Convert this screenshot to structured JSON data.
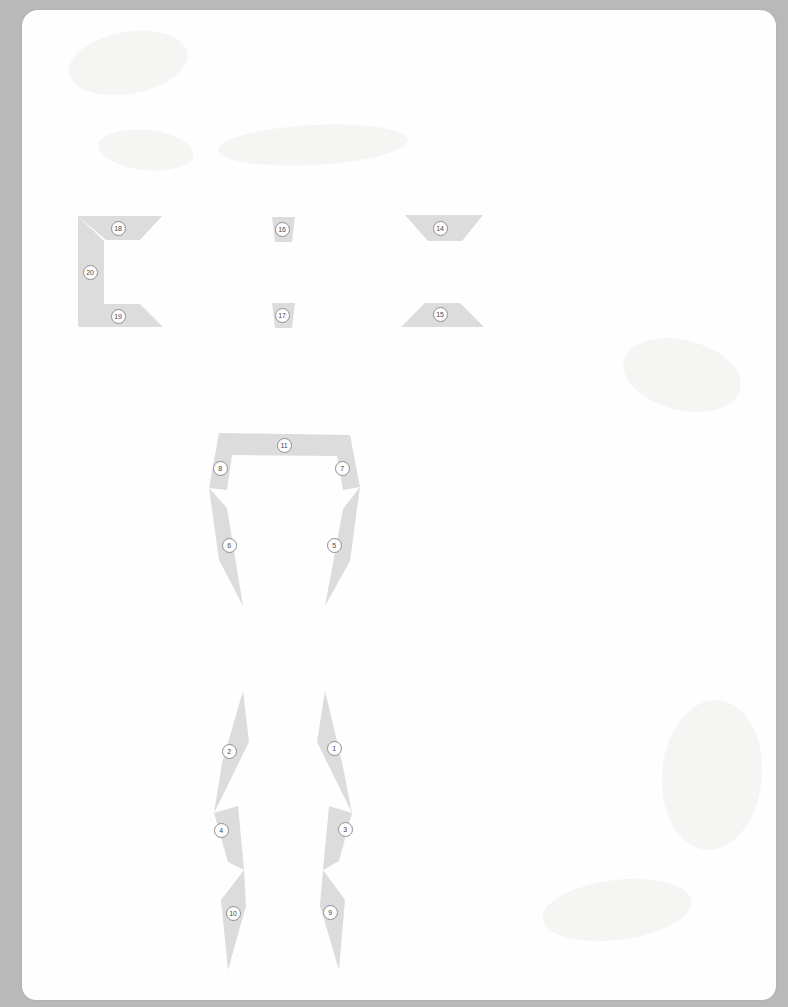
{
  "document": {
    "kind": "scanned-diagram-page",
    "background_color": "#b9b9b9",
    "page_color": "#fefefe",
    "segment_fill_color": "#dcdcdc",
    "badge_fill_color": "#fdfdfd",
    "badge_border_color": "#8f8f8f",
    "badge_text_color": "#4a4a4a"
  },
  "diagram": {
    "title": "",
    "groups": [
      {
        "name": "bracket-group",
        "label": "C-bracket assembly",
        "segments": [
          {
            "id": "segment-18",
            "label": "18",
            "role": "bracket-top-arm",
            "badge": {
              "x": 118,
              "y": 228
            },
            "points": "78,216 162,216 140,240 106,240"
          },
          {
            "id": "segment-20",
            "label": "20",
            "role": "bracket-spine",
            "badge": {
              "x": 90,
              "y": 272
            },
            "points": "78,216 104,241 104,305 78,327"
          },
          {
            "id": "segment-19",
            "label": "19",
            "role": "bracket-bottom-arm",
            "badge": {
              "x": 118,
              "y": 316
            },
            "points": "78,327 163,327 140,304 105,304"
          }
        ]
      },
      {
        "name": "colon-group",
        "label": "Small tapered pair",
        "segments": [
          {
            "id": "segment-16",
            "label": "16",
            "role": "small-upper-wedge",
            "badge": {
              "x": 282,
              "y": 229
            },
            "points": "272,217 295,217 292,242 275,242"
          },
          {
            "id": "segment-17",
            "label": "17",
            "role": "small-lower-wedge",
            "badge": {
              "x": 282,
              "y": 315
            },
            "points": "272,303 295,303 292,328 275,328"
          }
        ]
      },
      {
        "name": "chevron-group",
        "label": "Wide tapered pair",
        "segments": [
          {
            "id": "segment-14",
            "label": "14",
            "role": "wide-upper-wedge",
            "badge": {
              "x": 440,
              "y": 228
            },
            "points": "405,215 483,215 462,241 428,241"
          },
          {
            "id": "segment-15",
            "label": "15",
            "role": "wide-lower-wedge",
            "badge": {
              "x": 440,
              "y": 314
            },
            "points": "401,327 484,327 460,303 425,303"
          }
        ]
      },
      {
        "name": "torso-group",
        "label": "Upper body frame",
        "segments": [
          {
            "id": "segment-11",
            "label": "11",
            "role": "shoulder-crossbar",
            "badge": {
              "x": 284,
              "y": 445
            },
            "points": "219,433 350,435 337,456 232,455"
          },
          {
            "id": "segment-8",
            "label": "8",
            "role": "left-upper-arm",
            "badge": {
              "x": 220,
              "y": 468
            },
            "points": "219,433 232,455 227,490 209,488"
          },
          {
            "id": "segment-7",
            "label": "7",
            "role": "right-upper-arm",
            "badge": {
              "x": 342,
              "y": 468
            },
            "points": "350,435 337,456 343,490 360,487"
          },
          {
            "id": "segment-6",
            "label": "6",
            "role": "left-flank",
            "badge": {
              "x": 229,
              "y": 545
            },
            "points": "209,488 227,508 243,606 219,560"
          },
          {
            "id": "segment-5",
            "label": "5",
            "role": "right-flank",
            "badge": {
              "x": 334,
              "y": 545
            },
            "points": "360,487 343,509 325,606 350,561"
          }
        ]
      },
      {
        "name": "legs-group",
        "label": "Lower body frame",
        "segments": [
          {
            "id": "segment-2",
            "label": "2",
            "role": "left-thigh",
            "badge": {
              "x": 229,
              "y": 751
            },
            "points": "243,691 249,742 214,813 222,763"
          },
          {
            "id": "segment-1",
            "label": "1",
            "role": "right-thigh",
            "badge": {
              "x": 334,
              "y": 748
            },
            "points": "325,691 317,742 352,813 342,762"
          },
          {
            "id": "segment-4",
            "label": "4",
            "role": "left-shin",
            "badge": {
              "x": 221,
              "y": 830
            },
            "points": "214,813 238,806 244,870 228,862"
          },
          {
            "id": "segment-3",
            "label": "3",
            "role": "right-shin",
            "badge": {
              "x": 345,
              "y": 829
            },
            "points": "352,813 329,806 323,870 339,861"
          },
          {
            "id": "segment-10",
            "label": "10",
            "role": "left-foot",
            "badge": {
              "x": 233,
              "y": 913
            },
            "points": "244,870 246,906 228,970 221,900"
          },
          {
            "id": "segment-9",
            "label": "9",
            "role": "right-foot",
            "badge": {
              "x": 330,
              "y": 912
            },
            "points": "323,870 320,906 339,970 345,900"
          }
        ]
      }
    ]
  }
}
